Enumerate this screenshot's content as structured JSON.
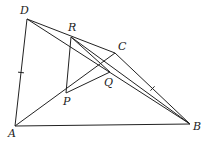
{
  "diagram": {
    "type": "geometry",
    "points": {
      "D": {
        "label": "D",
        "x": 27,
        "y": 19,
        "lx": 20,
        "ly": 14
      },
      "R": {
        "label": "R",
        "x": 71,
        "y": 37,
        "lx": 68,
        "ly": 31
      },
      "C": {
        "label": "C",
        "x": 115,
        "y": 53,
        "lx": 118,
        "ly": 50
      },
      "P": {
        "label": "P",
        "x": 66,
        "y": 93,
        "lx": 63,
        "ly": 105
      },
      "Q": {
        "label": "Q",
        "x": 110,
        "y": 72,
        "lx": 104,
        "ly": 86
      },
      "A": {
        "label": "A",
        "x": 15,
        "y": 126,
        "lx": 8,
        "ly": 137
      },
      "B": {
        "label": "B",
        "x": 190,
        "y": 124,
        "lx": 193,
        "ly": 130
      }
    },
    "segments": [
      [
        "D",
        "A"
      ],
      [
        "D",
        "C"
      ],
      [
        "D",
        "B"
      ],
      [
        "R",
        "P"
      ],
      [
        "R",
        "B"
      ],
      [
        "R",
        "Q"
      ],
      [
        "A",
        "C"
      ],
      [
        "A",
        "B"
      ],
      [
        "C",
        "B"
      ],
      [
        "P",
        "Q"
      ]
    ],
    "equal_marks": [
      [
        "D",
        "A"
      ],
      [
        "C",
        "B"
      ]
    ]
  }
}
